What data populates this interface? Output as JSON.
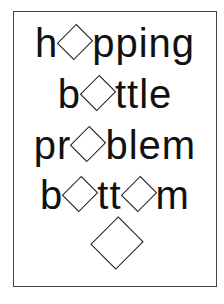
{
  "puzzle": {
    "lines": [
      {
        "before": "h",
        "after": "pping",
        "word_pattern": "h◇pping"
      },
      {
        "before": "b",
        "after": "ttle",
        "word_pattern": "b◇ttle"
      },
      {
        "before": "pr",
        "after": "blem",
        "word_pattern": "pr◇blem"
      },
      {
        "before": "b",
        "middle": "tt",
        "after": "m",
        "word_pattern": "b◇tt◇m"
      }
    ],
    "final_symbol": "diamond"
  }
}
